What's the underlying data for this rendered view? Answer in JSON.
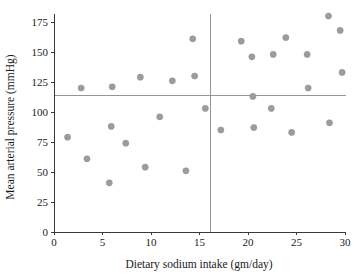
{
  "chart_data": {
    "type": "scatter",
    "title": "",
    "xlabel": "Dietary sodium intake (gm/day)",
    "ylabel": "Mean arterial pressure (mmHg)",
    "xlim": [
      0,
      30
    ],
    "ylim": [
      0,
      175
    ],
    "xticks": [
      0,
      5,
      10,
      15,
      20,
      25,
      30
    ],
    "yticks": [
      0,
      25,
      50,
      75,
      100,
      125,
      150,
      175
    ],
    "xtick_labels": [
      "0",
      "5",
      "10",
      "15",
      "20",
      "25",
      "30"
    ],
    "ytick_labels": [
      "0",
      "25",
      "50",
      "75",
      "100",
      "125",
      "150",
      "175"
    ],
    "grid": false,
    "legend": "none",
    "marker_color": "#9c9c9c",
    "reference_lines": [
      {
        "orientation": "horizontal",
        "value": 114,
        "color": "#8a8a8a",
        "label": "mean arterial pressure"
      },
      {
        "orientation": "vertical",
        "value": 16.1,
        "color": "#8a8a8a",
        "label": "mean sodium intake"
      }
    ],
    "points": [
      {
        "x": 1.4,
        "y": 79
      },
      {
        "x": 2.8,
        "y": 120
      },
      {
        "x": 3.4,
        "y": 61
      },
      {
        "x": 5.7,
        "y": 41
      },
      {
        "x": 5.9,
        "y": 88
      },
      {
        "x": 6.0,
        "y": 121
      },
      {
        "x": 7.4,
        "y": 74
      },
      {
        "x": 8.9,
        "y": 129
      },
      {
        "x": 9.4,
        "y": 54
      },
      {
        "x": 10.9,
        "y": 96
      },
      {
        "x": 12.2,
        "y": 126
      },
      {
        "x": 13.6,
        "y": 51
      },
      {
        "x": 14.3,
        "y": 161
      },
      {
        "x": 14.5,
        "y": 130
      },
      {
        "x": 15.6,
        "y": 103
      },
      {
        "x": 17.2,
        "y": 85
      },
      {
        "x": 19.3,
        "y": 159
      },
      {
        "x": 20.4,
        "y": 146
      },
      {
        "x": 20.5,
        "y": 113
      },
      {
        "x": 20.6,
        "y": 87
      },
      {
        "x": 22.4,
        "y": 103
      },
      {
        "x": 22.6,
        "y": 148
      },
      {
        "x": 23.9,
        "y": 162
      },
      {
        "x": 24.5,
        "y": 83
      },
      {
        "x": 26.1,
        "y": 148
      },
      {
        "x": 26.2,
        "y": 120
      },
      {
        "x": 28.3,
        "y": 180
      },
      {
        "x": 28.4,
        "y": 91
      },
      {
        "x": 29.5,
        "y": 168
      },
      {
        "x": 29.7,
        "y": 133
      }
    ]
  },
  "axes": {
    "x_title": "Dietary sodium intake (gm/day)",
    "y_title": "Mean arterial pressure (mmHg)"
  }
}
